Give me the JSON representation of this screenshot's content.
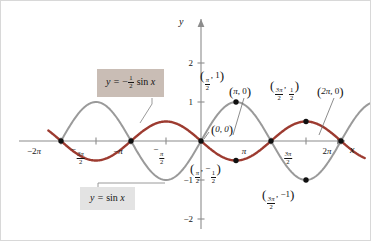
{
  "figure": {
    "background": "#ffffff",
    "border_color": "#d8d8d8"
  },
  "axes": {
    "x_axis_label": "x",
    "y_axis_label": "y",
    "origin_label": "(0, 0)",
    "x_ticks": [
      {
        "value": -6.283185,
        "label_parts": {
          "sign": "−2",
          "symbol": "π"
        },
        "text": "−2π"
      },
      {
        "value": -4.712389,
        "label_parts": {
          "sign": "−",
          "num": "3π",
          "den": "2"
        },
        "text": "−3π/2"
      },
      {
        "value": -3.141593,
        "label_parts": {
          "sign": "−",
          "symbol": "π"
        },
        "text": "−π"
      },
      {
        "value": -1.570796,
        "label_parts": {
          "sign": "−",
          "num": "π",
          "den": "2"
        },
        "text": "−π/2"
      },
      {
        "value": 3.141593,
        "label_parts": {
          "symbol": "π"
        },
        "text": "π"
      },
      {
        "value": 4.712389,
        "label_parts": {
          "num": "3π",
          "den": "2"
        },
        "text": "3π/2"
      },
      {
        "value": 6.283185,
        "label_parts": {
          "sign": "2",
          "symbol": "π"
        },
        "text": "2π"
      }
    ],
    "y_ticks": [
      {
        "value": 2,
        "text": "2"
      },
      {
        "value": 1,
        "text": "1"
      },
      {
        "value": -1,
        "text": "−1"
      },
      {
        "value": -2,
        "text": "−2"
      }
    ],
    "axis_color": "#8c8c8c",
    "xlim": [
      -7.4,
      7.9
    ],
    "ylim": [
      -2.55,
      2.6
    ]
  },
  "chart_data": {
    "type": "line",
    "title": "",
    "xlabel": "x",
    "ylabel": "y",
    "xlim": [
      -7.4,
      7.9
    ],
    "ylim": [
      -2.55,
      2.6
    ],
    "grid": false,
    "legend_position": "inline-callout",
    "series": [
      {
        "name": "y = sin x",
        "expression": "sin(x)",
        "amplitude": 1,
        "color": "#9a9a9a",
        "line_width": 2.0,
        "x_domain": [
          -6.283185,
          7.6
        ],
        "key_points": [
          {
            "x": -6.283185,
            "y": 0
          },
          {
            "x": -4.712389,
            "y": 1
          },
          {
            "x": -3.141593,
            "y": 0
          },
          {
            "x": -1.570796,
            "y": -1
          },
          {
            "x": 0,
            "y": 0
          },
          {
            "x": 1.570796,
            "y": 1
          },
          {
            "x": 3.141593,
            "y": 0
          },
          {
            "x": 4.712389,
            "y": -1
          },
          {
            "x": 6.283185,
            "y": 0
          }
        ]
      },
      {
        "name": "y = -1/2 sin x",
        "expression": "-0.5*sin(x)",
        "amplitude": -0.5,
        "color": "#9d3b30",
        "line_width": 2.4,
        "x_domain": [
          -6.85,
          7.35
        ],
        "key_points": [
          {
            "x": -6.283185,
            "y": 0
          },
          {
            "x": -4.712389,
            "y": -0.5
          },
          {
            "x": -3.141593,
            "y": 0
          },
          {
            "x": -1.570796,
            "y": 0.5
          },
          {
            "x": 0,
            "y": 0
          },
          {
            "x": 1.570796,
            "y": -0.5
          },
          {
            "x": 3.141593,
            "y": 0
          },
          {
            "x": 4.712389,
            "y": 0.5
          },
          {
            "x": 6.283185,
            "y": 0
          }
        ]
      }
    ],
    "marked_points": [
      {
        "x": -6.283185,
        "y": 0,
        "label": ""
      },
      {
        "x": -3.141593,
        "y": 0,
        "label": ""
      },
      {
        "x": 0,
        "y": 0,
        "label": "(0, 0)"
      },
      {
        "x": 1.570796,
        "y": 1,
        "label": "(π/2, 1)"
      },
      {
        "x": 1.570796,
        "y": -0.5,
        "label": "(π/2, −1/2)"
      },
      {
        "x": 3.141593,
        "y": 0,
        "label": "(π, 0)"
      },
      {
        "x": 4.712389,
        "y": 0.5,
        "label": "(3π/2, 1/2)"
      },
      {
        "x": 4.712389,
        "y": -1,
        "label": "(3π/2, −1)"
      },
      {
        "x": 6.283185,
        "y": 0,
        "label": "(2π, 0)"
      }
    ]
  },
  "point_labels": {
    "origin": {
      "text": "(0, 0)",
      "x_val": "0",
      "y_val": "0"
    },
    "peak_pi_over_2": {
      "num": "π",
      "den": "2",
      "y_val": "1"
    },
    "trough_pi_over_2": {
      "num": "π",
      "den": "2",
      "y_num": "1",
      "y_den": "2",
      "y_sign": "−"
    },
    "zero_pi": {
      "x_val": "π",
      "y_val": "0"
    },
    "peak_3pi_over_2": {
      "num": "3π",
      "den": "2",
      "y_num": "1",
      "y_den": "2"
    },
    "trough_3pi_over_2": {
      "num": "3π",
      "den": "2",
      "y_val": "−1"
    },
    "zero_2pi": {
      "x_val": "2π",
      "y_val": "0"
    }
  },
  "callouts": [
    {
      "id": "neg-half-sin",
      "equation_prefix": "y =",
      "sign": "−",
      "frac_num": "1",
      "frac_den": "2",
      "function": "sin",
      "variable": "x",
      "background": "#c9bdb5",
      "leader_color": "#8f8f8f"
    },
    {
      "id": "sin",
      "equation_prefix": "y =",
      "function": "sin",
      "variable": "x",
      "background": "#e3e3e3",
      "leader_color": "#8f8f8f"
    }
  ]
}
